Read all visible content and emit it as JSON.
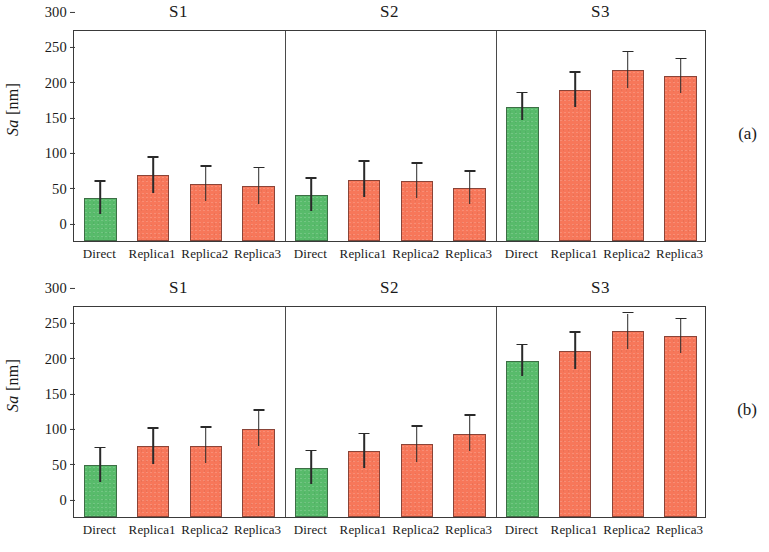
{
  "figure": {
    "panels": [
      {
        "letter": "(a)"
      },
      {
        "letter": "(b)"
      }
    ],
    "axis": {
      "ylabel_italic": "Sa",
      "ylabel_unit": " [nm]",
      "yticks": [
        0,
        50,
        100,
        150,
        200,
        250,
        300
      ],
      "ylim": [
        0,
        300
      ]
    },
    "groups": [
      "S1",
      "S2",
      "S3"
    ],
    "categories": [
      "Direct",
      "Replica1",
      "Replica2",
      "Replica3"
    ],
    "colors": {
      "direct": "#58bb6b",
      "replica": "#f7775a",
      "axis": "#3a3a3a",
      "errorbar": "#2a2a2a"
    }
  },
  "chart_data": [
    {
      "type": "bar",
      "title": "(a)",
      "xlabel": "",
      "ylabel": "Sa [nm]",
      "ylim": [
        0,
        300
      ],
      "yticks": [
        0,
        50,
        100,
        150,
        200,
        250,
        300
      ],
      "grid": false,
      "legend": "none",
      "groups": [
        "S1",
        "S2",
        "S3"
      ],
      "categories": [
        "Direct",
        "Replica1",
        "Replica2",
        "Replica3"
      ],
      "bars": [
        {
          "group": "S1",
          "category": "Direct",
          "value": 61,
          "error": 23,
          "color": "#58bb6b"
        },
        {
          "group": "S1",
          "category": "Replica1",
          "value": 93,
          "error": 25,
          "color": "#f7775a"
        },
        {
          "group": "S1",
          "category": "Replica2",
          "value": 81,
          "error": 24,
          "color": "#f7775a"
        },
        {
          "group": "S1",
          "category": "Replica3",
          "value": 78,
          "error": 25,
          "color": "#f7775a"
        },
        {
          "group": "S2",
          "category": "Direct",
          "value": 65,
          "error": 23,
          "color": "#58bb6b"
        },
        {
          "group": "S2",
          "category": "Replica1",
          "value": 87,
          "error": 25,
          "color": "#f7775a"
        },
        {
          "group": "S2",
          "category": "Replica2",
          "value": 85,
          "error": 24,
          "color": "#f7775a"
        },
        {
          "group": "S2",
          "category": "Replica3",
          "value": 75,
          "error": 23,
          "color": "#f7775a"
        },
        {
          "group": "S3",
          "category": "Direct",
          "value": 190,
          "error": 19,
          "color": "#58bb6b"
        },
        {
          "group": "S3",
          "category": "Replica1",
          "value": 214,
          "error": 24,
          "color": "#f7775a"
        },
        {
          "group": "S3",
          "category": "Replica2",
          "value": 242,
          "error": 25,
          "color": "#f7775a"
        },
        {
          "group": "S3",
          "category": "Replica3",
          "value": 233,
          "error": 24,
          "color": "#f7775a"
        }
      ]
    },
    {
      "type": "bar",
      "title": "(b)",
      "xlabel": "",
      "ylabel": "Sa [nm]",
      "ylim": [
        0,
        300
      ],
      "yticks": [
        0,
        50,
        100,
        150,
        200,
        250,
        300
      ],
      "grid": false,
      "legend": "none",
      "groups": [
        "S1",
        "S2",
        "S3"
      ],
      "categories": [
        "Direct",
        "Replica1",
        "Replica2",
        "Replica3"
      ],
      "bars": [
        {
          "group": "S1",
          "category": "Direct",
          "value": 73,
          "error": 24,
          "color": "#58bb6b"
        },
        {
          "group": "S1",
          "category": "Replica1",
          "value": 100,
          "error": 25,
          "color": "#f7775a"
        },
        {
          "group": "S1",
          "category": "Replica2",
          "value": 101,
          "error": 25,
          "color": "#f7775a"
        },
        {
          "group": "S1",
          "category": "Replica3",
          "value": 125,
          "error": 25,
          "color": "#f7775a"
        },
        {
          "group": "S2",
          "category": "Direct",
          "value": 70,
          "error": 23,
          "color": "#58bb6b"
        },
        {
          "group": "S2",
          "category": "Replica1",
          "value": 93,
          "error": 24,
          "color": "#f7775a"
        },
        {
          "group": "S2",
          "category": "Replica2",
          "value": 103,
          "error": 25,
          "color": "#f7775a"
        },
        {
          "group": "S2",
          "category": "Replica3",
          "value": 118,
          "error": 25,
          "color": "#f7775a"
        },
        {
          "group": "S3",
          "category": "Direct",
          "value": 221,
          "error": 22,
          "color": "#58bb6b"
        },
        {
          "group": "S3",
          "category": "Replica1",
          "value": 235,
          "error": 26,
          "color": "#f7775a"
        },
        {
          "group": "S3",
          "category": "Replica2",
          "value": 263,
          "error": 25,
          "color": "#f7775a"
        },
        {
          "group": "S3",
          "category": "Replica3",
          "value": 256,
          "error": 24,
          "color": "#f7775a"
        }
      ]
    }
  ]
}
